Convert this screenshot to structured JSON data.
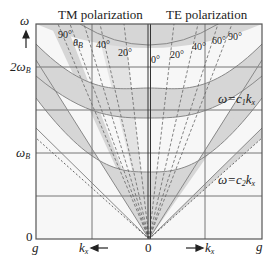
{
  "titles": {
    "left": "TM polarization",
    "right": "TE polarization"
  },
  "y_axis": {
    "symbol": "ω",
    "ticks": [
      {
        "label": "2ω",
        "sub": "B",
        "y": 67
      },
      {
        "label": "ω",
        "sub": "B",
        "y": 153
      },
      {
        "label": "0",
        "sub": "",
        "y": 239
      }
    ]
  },
  "x_axis": {
    "left_label": "k",
    "left_sub": "x",
    "left_arrow": "←",
    "right_label": "k",
    "right_sub": "x",
    "right_arrow": "→",
    "center": "0",
    "left_edge": "g",
    "right_edge": "g"
  },
  "angles_tm": [
    {
      "text": "90°"
    },
    {
      "text": "θ",
      "sub": "B"
    },
    {
      "text": "40°"
    },
    {
      "text": "20°"
    }
  ],
  "angles_te": [
    {
      "text": "0°"
    },
    {
      "text": "20°"
    },
    {
      "text": "40°"
    },
    {
      "text": "60°"
    },
    {
      "text": "90°"
    }
  ],
  "light_lines": [
    {
      "label": "ω=c",
      "sub": "1",
      "var": "k",
      "var_sub": "x"
    },
    {
      "label": "ω=c",
      "sub": "2",
      "var": "k",
      "var_sub": "x"
    }
  ],
  "colors": {
    "band": "#d6d6d6",
    "grid": "#777777",
    "frame": "#555555",
    "bg": "#f7f7f7"
  }
}
